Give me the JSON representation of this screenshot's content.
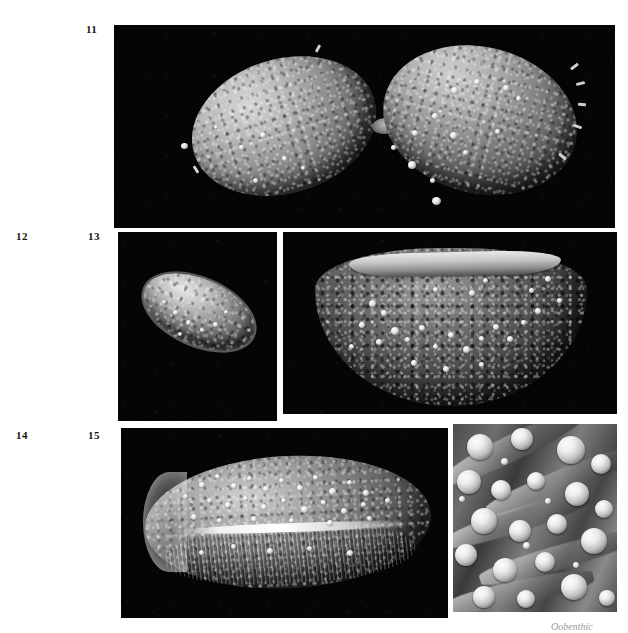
{
  "plate": {
    "type": "scientific-micrograph-plate",
    "background_color": "#ffffff",
    "panel_background_color": "#000000",
    "width": 628,
    "height": 633
  },
  "labels": [
    {
      "id": "fig-11",
      "text": "11",
      "x": 86,
      "y": 24
    },
    {
      "id": "fig-12",
      "text": "12",
      "x": 16,
      "y": 231
    },
    {
      "id": "fig-13",
      "text": "13",
      "x": 88,
      "y": 231
    },
    {
      "id": "fig-14",
      "text": "14",
      "x": 16,
      "y": 430
    },
    {
      "id": "fig-15",
      "text": "15",
      "x": 88,
      "y": 430
    }
  ],
  "panels": [
    {
      "id": "panel-11",
      "figure": "11",
      "subject": "two ovoid spores joined at a narrow isthmus, granular surface with scattered bright spherules",
      "x": 114,
      "y": 25,
      "width": 501,
      "height": 203
    },
    {
      "id": "panel-12",
      "figure": "12",
      "subject": "single small elongate spore, coarsely granular, bright rim",
      "x": 118,
      "y": 232,
      "width": 159,
      "height": 189
    },
    {
      "id": "panel-13",
      "figure": "13",
      "subject": "crescent-shaped spore half, reticulate pitted wall with dense spherules",
      "x": 283,
      "y": 232,
      "width": 334,
      "height": 182
    },
    {
      "id": "panel-14",
      "figure": "14",
      "subject": "large elongate spore with median suture and dense spherule coating",
      "x": 121,
      "y": 428,
      "width": 327,
      "height": 190
    },
    {
      "id": "panel-15",
      "figure": "15",
      "subject": "high magnification detail of wall ridges and spherical bodies",
      "x": 453,
      "y": 424,
      "width": 164,
      "height": 188
    }
  ],
  "caption": {
    "text": "Oobenthic",
    "x": 551,
    "y": 622,
    "note": "faint partially-cropped caption fragment at lower right edge"
  },
  "colors": {
    "page": "#ffffff",
    "panel": "#000000",
    "label": "#141414",
    "bead_highlight": "#ffffff",
    "caption": "#9a9a9a"
  }
}
